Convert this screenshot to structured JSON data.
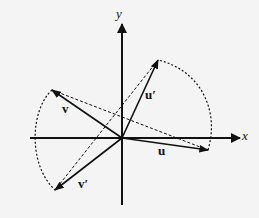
{
  "diagram": {
    "type": "vector-rotation",
    "axes": {
      "x_label": "x",
      "y_label": "y"
    },
    "origin": [
      122,
      138
    ],
    "vectors": [
      {
        "name": "u",
        "label": "u",
        "tip": [
          208,
          150
        ],
        "style": "solid"
      },
      {
        "name": "v",
        "label": "v",
        "tip": [
          52,
          90
        ],
        "style": "solid"
      },
      {
        "name": "u_prime",
        "label": "u′",
        "tip": [
          158,
          60
        ],
        "style": "solid"
      },
      {
        "name": "v_prime",
        "label": "v′",
        "tip": [
          55,
          190
        ],
        "style": "solid"
      }
    ],
    "dashed_lines": [
      {
        "from": "v",
        "to": "u"
      },
      {
        "from": "u_prime",
        "to": "v_prime"
      }
    ],
    "arcs": [
      {
        "from": "u",
        "to": "u_prime",
        "style": "dotted"
      },
      {
        "from": "v",
        "to": "v_prime",
        "style": "dotted"
      }
    ],
    "colors": {
      "ink": "#111111",
      "background": "#f4f4f4"
    }
  }
}
